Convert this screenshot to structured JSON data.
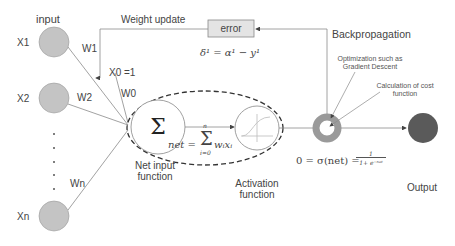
{
  "labels": {
    "input": "input",
    "weight_update": "Weight update",
    "error": "error",
    "backpropagation": "Backpropagation",
    "optimization": "Optimization such as Gradient Descent",
    "optimization_l1": "Optimization such as",
    "optimization_l2": "Gradient Descent",
    "cost": "Calculation of cost function",
    "cost_l1": "Calculation of cost",
    "cost_l2": "function",
    "net_input_l1": "Net input",
    "net_input_l2": "function",
    "activation_l1": "Activation",
    "activation_l2": "function",
    "output": "Output",
    "x1": "X1",
    "x2": "X2",
    "xn": "Xn",
    "w1": "W1",
    "w2": "W2",
    "wn": "Wn",
    "w0": "W0",
    "x0": "X0 =1",
    "dots": "·"
  },
  "formulas": {
    "delta": "δ¹ = α¹ − y¹",
    "net": "net = Σ wᵢxᵢ (i=0..n)",
    "net_lhs": "net =",
    "net_sum": "Σ",
    "net_top": "n",
    "net_bottom": "i=0",
    "net_rhs": "wᵢxᵢ",
    "sigma": "0 = σ(net) =",
    "sigma_num": "1",
    "sigma_den": "1+ e⁻ⁿᵉᵗ",
    "sum_symbol": "Σ"
  },
  "colors": {
    "input_node": "#c4c4c4",
    "ring": "#9a9a9a",
    "output_node": "#5a5a5a",
    "line": "#8a8a8a",
    "error_box": "#e4e4e4"
  }
}
